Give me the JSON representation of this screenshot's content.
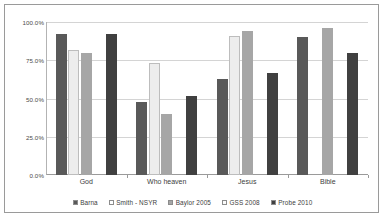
{
  "chart_data": {
    "type": "bar",
    "title": "",
    "xlabel": "",
    "ylabel": "",
    "ylim": [
      0,
      100
    ],
    "grid": true,
    "legend_position": "bottom",
    "categories": [
      "God",
      "Who heaven",
      "Jesus",
      "Bible"
    ],
    "ytick_labels": [
      "0.0%",
      "25.0%",
      "50.0%",
      "75.0%",
      "100.0%"
    ],
    "ytick_values": [
      0,
      25,
      50,
      75,
      100
    ],
    "series": [
      {
        "name": "Barna",
        "color": "#595959",
        "values": [
          92.0,
          48.0,
          62.5,
          90.0
        ]
      },
      {
        "name": "Smith - NSYR",
        "color": "#ededed",
        "values": [
          82.0,
          73.0,
          91.0,
          null
        ]
      },
      {
        "name": "Baylor 2005",
        "color": "#a6a6a6",
        "values": [
          80.0,
          40.0,
          94.0,
          96.0
        ]
      },
      {
        "name": "GSS 2008",
        "color": "#f7f7f7",
        "values": [
          null,
          null,
          null,
          null
        ]
      },
      {
        "name": "Probe 2010",
        "color": "#404040",
        "values": [
          92.0,
          51.5,
          66.5,
          79.5
        ]
      }
    ]
  },
  "legend": {
    "items": [
      {
        "label": "Barna",
        "swatch": "#595959"
      },
      {
        "label": "Smith - NSYR",
        "swatch": "#ffffff"
      },
      {
        "label": "Baylor 2005",
        "swatch": "#a6a6a6"
      },
      {
        "label": "GSS 2008",
        "swatch": "#fbfbfb"
      },
      {
        "label": "Probe 2010",
        "swatch": "#404040"
      }
    ]
  }
}
